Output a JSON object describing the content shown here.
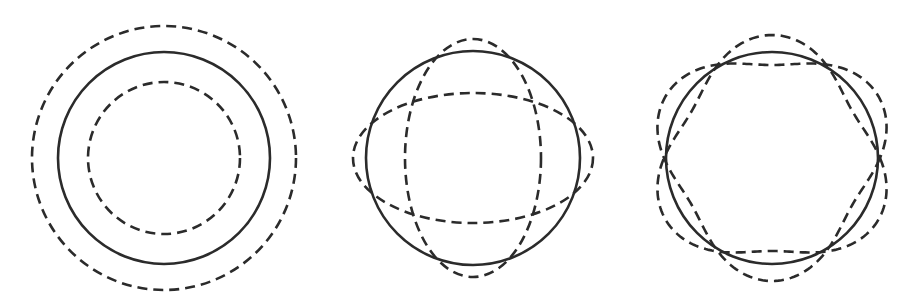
{
  "diagram": {
    "title": "",
    "stroke_color": "#2b2b2b",
    "background": "#ffffff",
    "panels": [
      {
        "id": "mode-breathing",
        "description": "Concentric circles: equilibrium circle (solid) with expanded and contracted dashed circles",
        "center": [
          164,
          158
        ],
        "solid_radius": 106,
        "dashed_shapes": [
          {
            "type": "circle",
            "r": 132
          },
          {
            "type": "circle",
            "r": 76
          }
        ]
      },
      {
        "id": "mode-n2",
        "description": "Circle (solid) with two dashed ellipses (horizontal and vertical) — quadrupole oscillation",
        "center": [
          473,
          158
        ],
        "solid_radius": 107,
        "dashed_shapes": [
          {
            "type": "ellipse",
            "rx": 120,
            "ry": 65
          },
          {
            "type": "ellipse",
            "rx": 68,
            "ry": 119
          }
        ]
      },
      {
        "id": "mode-n3",
        "description": "Circle (solid) with two dashed three-lobed curves rotated 60° apart — octupole oscillation",
        "center": [
          772,
          158
        ],
        "solid_radius": 106,
        "dashed_shapes": [
          {
            "type": "lobed",
            "n": 3,
            "r": 108,
            "a": 15,
            "phase_deg": -90
          },
          {
            "type": "lobed",
            "n": 3,
            "r": 108,
            "a": 15,
            "phase_deg": 90
          }
        ]
      }
    ]
  }
}
